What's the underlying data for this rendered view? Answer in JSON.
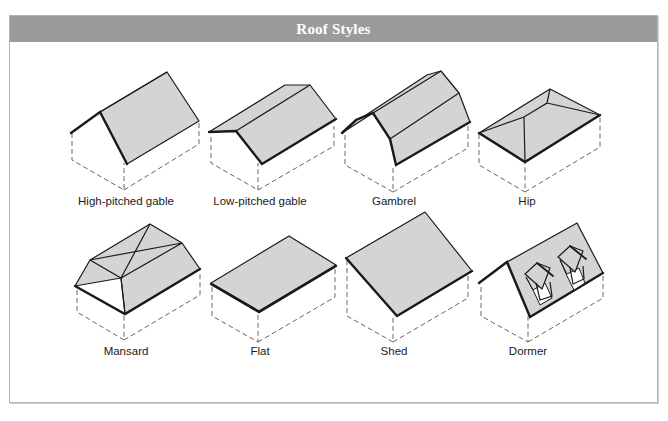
{
  "header": {
    "title": "Roof Styles"
  },
  "colors": {
    "header_bg": "#9b9b9b",
    "roof_fill": "#d4d4d4",
    "line": "#1a1a1a",
    "panel_border": "#b3b3b3"
  },
  "roof_styles": [
    {
      "label": "High-pitched gable",
      "icon": "high-pitched-gable-roof-icon"
    },
    {
      "label": "Low-pitched gable",
      "icon": "low-pitched-gable-roof-icon"
    },
    {
      "label": "Gambrel",
      "icon": "gambrel-roof-icon"
    },
    {
      "label": "Hip",
      "icon": "hip-roof-icon"
    },
    {
      "label": "Mansard",
      "icon": "mansard-roof-icon"
    },
    {
      "label": "Flat",
      "icon": "flat-roof-icon"
    },
    {
      "label": "Shed",
      "icon": "shed-roof-icon"
    },
    {
      "label": "Dormer",
      "icon": "dormer-roof-icon"
    }
  ]
}
